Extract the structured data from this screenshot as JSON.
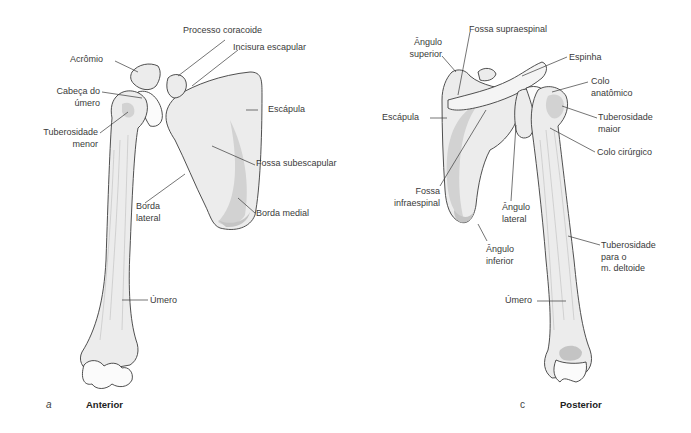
{
  "figure": {
    "panels": [
      {
        "id": "a",
        "letter": "a",
        "view_label": "Anterior",
        "labels": {
          "processo_coracoide": "Processo coracoide",
          "incisura_escapular": "Incisura escapular",
          "acromio": "Acrômio",
          "cabeca_umero_1": "Cabeça do",
          "cabeca_umero_2": "úmero",
          "escapula": "Escápula",
          "tuberosidade_menor_1": "Tuberosidade",
          "tuberosidade_menor_2": "menor",
          "fossa_subescapular": "Fossa subescapular",
          "borda_lateral_1": "Borda",
          "borda_lateral_2": "lateral",
          "borda_medial": "Borda medial",
          "umero": "Úmero"
        }
      },
      {
        "id": "c",
        "letter": "c",
        "view_label": "Posterior",
        "labels": {
          "fossa_supraespinal": "Fossa supraespinal",
          "angulo_superior_1": "Ângulo",
          "angulo_superior_2": "superior",
          "espinha": "Espinha",
          "colo_anatomico_1": "Colo",
          "colo_anatomico_2": "anatômico",
          "escapula": "Escápula",
          "tuberosidade_maior_1": "Tuberosidade",
          "tuberosidade_maior_2": "maior",
          "colo_cirurgico": "Colo cirúrgico",
          "fossa_infraespinal_1": "Fossa",
          "fossa_infraespinal_2": "infraespinal",
          "angulo_lateral_1": "Ângulo",
          "angulo_lateral_2": "lateral",
          "angulo_inferior_1": "Ângulo",
          "angulo_inferior_2": "inferior",
          "tuberosidade_deltoide_1": "Tuberosidade",
          "tuberosidade_deltoide_2": "para o",
          "tuberosidade_deltoide_3": "m. deltoide",
          "umero": "Úmero"
        }
      }
    ]
  },
  "colors": {
    "bone_fill": "#ececec",
    "bone_shade": "#d2d2d2",
    "outline": "#3c3c3c",
    "label_text": "#3a3a3a",
    "background": "#ffffff"
  }
}
